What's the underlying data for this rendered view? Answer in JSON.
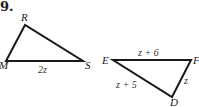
{
  "problem": {
    "number": "9."
  },
  "triangles": [
    {
      "name": "RMS",
      "vertices": {
        "R": {
          "label": "R",
          "x": 25,
          "y": 25
        },
        "M": {
          "label": "M",
          "x": 6,
          "y": 61
        },
        "S": {
          "label": "S",
          "x": 83,
          "y": 61
        }
      },
      "sides": [
        {
          "between": [
            "M",
            "S"
          ],
          "label": "2z"
        }
      ]
    },
    {
      "name": "EFD",
      "vertices": {
        "E": {
          "label": "E",
          "x": 113,
          "y": 60
        },
        "F": {
          "label": "F",
          "x": 191,
          "y": 60
        },
        "D": {
          "label": "D",
          "x": 172,
          "y": 97
        }
      },
      "sides": [
        {
          "between": [
            "E",
            "F"
          ],
          "label": "z + 6"
        },
        {
          "between": [
            "E",
            "D"
          ],
          "label": "z + 5"
        },
        {
          "between": [
            "F",
            "D"
          ],
          "label": "z"
        }
      ]
    }
  ],
  "colors": {
    "stroke": "#1a1a1a",
    "background": "#ffffff"
  }
}
